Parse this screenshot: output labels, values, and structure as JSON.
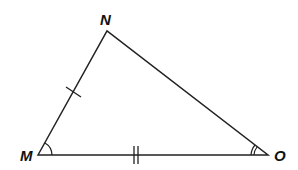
{
  "diagram": {
    "type": "triangle",
    "vertices": {
      "M": {
        "label": "M",
        "x": 38,
        "y": 155
      },
      "N": {
        "label": "N",
        "x": 107,
        "y": 31
      },
      "O": {
        "label": "O",
        "x": 268,
        "y": 155
      }
    },
    "marks": {
      "side_MN": "single tick",
      "side_MO": "double tick",
      "angle_M": "single arc",
      "angle_O": "double arc"
    },
    "stroke_color": "#222222"
  }
}
